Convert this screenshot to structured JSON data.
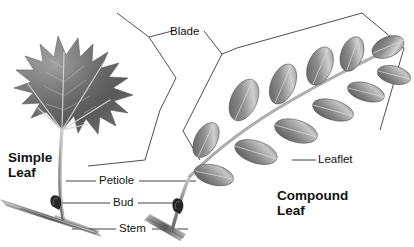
{
  "figure": {
    "background_color": "#ffffff",
    "line_color": "#3a3a3a",
    "text_color": "#111111"
  },
  "labels": {
    "blade": "Blade",
    "leaflet": "Leaflet",
    "petiole": "Petiole",
    "bud": "Bud",
    "stem": "Stem",
    "simple_leaf_line1": "Simple",
    "simple_leaf_line2": "Leaf",
    "compound_leaf_line1": "Compound",
    "compound_leaf_line2": "Leaf"
  },
  "specimens": [
    {
      "name": "simple-leaf",
      "common_form": "maple",
      "lobes": 5,
      "margin": "serrated",
      "venation": "palmate",
      "parts": [
        "Blade",
        "Petiole",
        "Bud",
        "Stem"
      ]
    },
    {
      "name": "compound-leaf",
      "common_form": "pinnate",
      "leaflet_pairs": 6,
      "leaflet_shape": "oval",
      "venation": "pinnate",
      "parts": [
        "Blade",
        "Leaflet",
        "Petiole",
        "Bud",
        "Stem"
      ]
    }
  ],
  "palette": {
    "leaf_dark": "#4d4d4d",
    "leaf_mid": "#8a8a8a",
    "leaf_light": "#c4c4c4",
    "vein": "#d8d8d8",
    "stem_gray": "#9a9a9a",
    "bud_dark": "#262626"
  }
}
